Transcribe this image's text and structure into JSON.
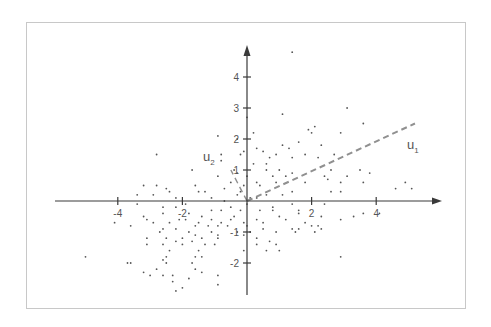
{
  "chart_data": {
    "type": "scatter",
    "title": "",
    "xlabel": "",
    "ylabel": "",
    "xlim": [
      -5.9,
      6.1
    ],
    "ylim": [
      -3.0,
      5.0
    ],
    "grid": false,
    "legend": null,
    "x_ticks": [
      -4,
      -2,
      2,
      4
    ],
    "y_ticks": [
      -2,
      -1,
      1,
      2,
      3,
      4
    ],
    "x_tick_labels": [
      "-4",
      "-2",
      "2",
      "4"
    ],
    "y_tick_labels": [
      "-2",
      "-1",
      "1",
      "2",
      "3",
      "4"
    ],
    "vectors": [
      {
        "name": "u1",
        "label": "u",
        "subscript": "1",
        "from": [
          0,
          0
        ],
        "to": [
          5.2,
          2.5
        ],
        "style": "dashed"
      },
      {
        "name": "u2",
        "label": "u",
        "subscript": "2",
        "from": [
          0,
          0
        ],
        "to": [
          -0.5,
          1.0
        ],
        "style": "dashed"
      }
    ],
    "series": [
      {
        "name": "points",
        "points": [
          [
            1.4,
            4.8
          ],
          [
            3.1,
            3.0
          ],
          [
            0.0,
            2.7
          ],
          [
            1.1,
            2.8
          ],
          [
            3.6,
            2.5
          ],
          [
            1.9,
            2.3
          ],
          [
            2.1,
            2.4
          ],
          [
            2.0,
            2.2
          ],
          [
            2.9,
            2.2
          ],
          [
            0.2,
            2.2
          ],
          [
            -0.9,
            2.1
          ],
          [
            -0.3,
            2.0
          ],
          [
            1.1,
            1.8
          ],
          [
            1.6,
            1.9
          ],
          [
            2.3,
            1.8
          ],
          [
            1.3,
            1.7
          ],
          [
            -0.1,
            1.6
          ],
          [
            0.3,
            1.7
          ],
          [
            0.5,
            1.6
          ],
          [
            0.9,
            1.5
          ],
          [
            -2.8,
            1.5
          ],
          [
            -0.8,
            1.5
          ],
          [
            -0.2,
            1.5
          ],
          [
            1.8,
            1.5
          ],
          [
            2.7,
            1.5
          ],
          [
            0.7,
            1.4
          ],
          [
            1.4,
            1.4
          ],
          [
            0.6,
            1.2
          ],
          [
            0.2,
            1.2
          ],
          [
            -0.8,
            1.3
          ],
          [
            2.2,
            1.4
          ],
          [
            -1.7,
            1.0
          ],
          [
            -0.4,
            1.0
          ],
          [
            0.6,
            1.0
          ],
          [
            1.0,
            1.0
          ],
          [
            2.6,
            1.0
          ],
          [
            1.4,
            0.9
          ],
          [
            3.5,
            1.0
          ],
          [
            3.8,
            0.9
          ],
          [
            -0.9,
            0.8
          ],
          [
            -0.3,
            0.9
          ],
          [
            0.0,
            0.8
          ],
          [
            0.8,
            0.8
          ],
          [
            1.2,
            0.8
          ],
          [
            2.4,
            0.8
          ],
          [
            3.1,
            0.8
          ],
          [
            2.5,
            0.7
          ],
          [
            2.9,
            0.6
          ],
          [
            0.3,
            0.6
          ],
          [
            -0.5,
            0.6
          ],
          [
            -1.6,
            0.5
          ],
          [
            -3.2,
            0.5
          ],
          [
            -2.8,
            0.5
          ],
          [
            0.9,
            0.6
          ],
          [
            1.8,
            0.6
          ],
          [
            3.6,
            0.6
          ],
          [
            4.9,
            0.6
          ],
          [
            -0.1,
            0.5
          ],
          [
            0.4,
            0.5
          ],
          [
            -1.3,
            0.3
          ],
          [
            -2.5,
            0.4
          ],
          [
            -2.4,
            0.3
          ],
          [
            -0.7,
            0.4
          ],
          [
            -0.2,
            0.3
          ],
          [
            1.4,
            0.3
          ],
          [
            2.6,
            0.3
          ],
          [
            4.6,
            0.4
          ],
          [
            5.1,
            0.4
          ],
          [
            2.9,
            0.3
          ],
          [
            -1.5,
            0.3
          ],
          [
            -0.3,
            0.2
          ],
          [
            0.6,
            0.2
          ],
          [
            1.1,
            0.2
          ],
          [
            -3.4,
            0.2
          ],
          [
            -2.9,
            0.2
          ],
          [
            -2.2,
            0.1
          ],
          [
            -1.1,
            0.1
          ],
          [
            0.1,
            0.1
          ],
          [
            0.3,
            0.1
          ],
          [
            -0.7,
            0.0
          ],
          [
            -3.4,
            -0.1
          ],
          [
            -1.9,
            -0.1
          ],
          [
            0.0,
            -0.1
          ],
          [
            1.4,
            -0.1
          ],
          [
            2.4,
            -0.1
          ],
          [
            -0.5,
            -0.2
          ],
          [
            0.8,
            -0.2
          ],
          [
            -2.2,
            -0.2
          ],
          [
            -2.6,
            -0.2
          ],
          [
            -1.1,
            -0.3
          ],
          [
            -0.2,
            -0.3
          ],
          [
            1.6,
            -0.3
          ],
          [
            -2.6,
            -0.4
          ],
          [
            -1.8,
            -0.4
          ],
          [
            -0.8,
            -0.3
          ],
          [
            0.4,
            -0.3
          ],
          [
            0.8,
            -0.3
          ],
          [
            1.6,
            -0.4
          ],
          [
            -3.2,
            -0.5
          ],
          [
            -1.4,
            -0.5
          ],
          [
            -0.4,
            -0.5
          ],
          [
            1.0,
            -0.5
          ],
          [
            2.3,
            -0.5
          ],
          [
            -2.9,
            -0.7
          ],
          [
            -2.1,
            -0.6
          ],
          [
            -1.9,
            -0.6
          ],
          [
            -1.1,
            -0.6
          ],
          [
            -0.5,
            -0.6
          ],
          [
            -0.1,
            -0.7
          ],
          [
            0.3,
            -0.6
          ],
          [
            1.2,
            -0.6
          ],
          [
            3.3,
            -0.5
          ],
          [
            3.6,
            -0.4
          ],
          [
            4.1,
            -0.4
          ],
          [
            -3.1,
            -0.6
          ],
          [
            -2.4,
            -0.7
          ],
          [
            -1.5,
            -0.7
          ],
          [
            -0.8,
            -0.7
          ],
          [
            0.5,
            -0.7
          ],
          [
            1.8,
            -0.7
          ],
          [
            2.9,
            -0.6
          ],
          [
            -4.1,
            -0.7
          ],
          [
            -3.6,
            -0.8
          ],
          [
            -2.6,
            -0.9
          ],
          [
            -1.6,
            -0.8
          ],
          [
            -1.2,
            -0.8
          ],
          [
            -0.9,
            -0.8
          ],
          [
            -0.6,
            -0.8
          ],
          [
            0.0,
            -0.8
          ],
          [
            1.4,
            -0.9
          ],
          [
            2.0,
            -0.8
          ],
          [
            2.2,
            -0.8
          ],
          [
            -2.2,
            -0.9
          ],
          [
            -1.8,
            -1.0
          ],
          [
            -2.7,
            -1.0
          ],
          [
            -1.1,
            -1.0
          ],
          [
            -0.3,
            -1.0
          ],
          [
            0.5,
            -0.9
          ],
          [
            0.9,
            -1.0
          ],
          [
            1.6,
            -0.9
          ],
          [
            1.5,
            -1.0
          ],
          [
            2.1,
            -1.0
          ],
          [
            2.3,
            -0.9
          ],
          [
            -0.9,
            -1.1
          ],
          [
            -0.1,
            -1.1
          ],
          [
            0.1,
            -1.0
          ],
          [
            0.3,
            -1.2
          ],
          [
            -1.6,
            -1.1
          ],
          [
            -2.0,
            -1.2
          ],
          [
            -2.5,
            -1.2
          ],
          [
            -3.1,
            -1.2
          ],
          [
            -1.4,
            -1.2
          ],
          [
            -0.9,
            -1.2
          ],
          [
            -2.2,
            -1.3
          ],
          [
            -1.7,
            -1.3
          ],
          [
            -1.3,
            -1.4
          ],
          [
            0.7,
            -1.3
          ],
          [
            -3.1,
            -1.4
          ],
          [
            -2.6,
            -1.4
          ],
          [
            -2.0,
            -1.4
          ],
          [
            -1.0,
            -1.4
          ],
          [
            0.3,
            -1.4
          ],
          [
            0.9,
            -1.4
          ],
          [
            -2.4,
            -1.6
          ],
          [
            -1.5,
            -1.6
          ],
          [
            0.6,
            -1.6
          ],
          [
            1.0,
            -1.6
          ],
          [
            -0.1,
            -1.6
          ],
          [
            -2.5,
            -1.8
          ],
          [
            -1.6,
            -1.8
          ],
          [
            -1.4,
            -1.8
          ],
          [
            -5.0,
            -1.8
          ],
          [
            2.9,
            -1.8
          ],
          [
            -3.7,
            -2.0
          ],
          [
            -3.6,
            -2.0
          ],
          [
            -2.6,
            -1.9
          ],
          [
            -2.5,
            -2.0
          ],
          [
            -1.7,
            -2.0
          ],
          [
            -1.6,
            -2.2
          ],
          [
            -2.8,
            -2.2
          ],
          [
            -1.4,
            -2.3
          ],
          [
            -3.2,
            -2.3
          ],
          [
            -2.6,
            -2.4
          ],
          [
            -2.3,
            -2.4
          ],
          [
            -0.9,
            -2.4
          ],
          [
            -3.0,
            -2.4
          ],
          [
            -1.8,
            -2.5
          ],
          [
            -2.3,
            -2.6
          ],
          [
            -0.9,
            -2.7
          ],
          [
            -2.2,
            -2.9
          ],
          [
            -2.0,
            -2.8
          ]
        ]
      }
    ]
  },
  "axes": {
    "x_ticks": [
      {
        "value": -4,
        "label": "-4"
      },
      {
        "value": -2,
        "label": "-2"
      },
      {
        "value": 2,
        "label": "2"
      },
      {
        "value": 4,
        "label": "4"
      }
    ],
    "y_ticks": [
      {
        "value": 4,
        "label": "4"
      },
      {
        "value": 3,
        "label": "3"
      },
      {
        "value": 2,
        "label": "2"
      },
      {
        "value": 1,
        "label": "1"
      },
      {
        "value": -1,
        "label": "-1"
      },
      {
        "value": -2,
        "label": "-2"
      }
    ]
  },
  "labels": {
    "u1_main": "u",
    "u1_sub": "1",
    "u2_main": "u",
    "u2_sub": "2"
  },
  "colors": {
    "axis": "#3a3a3a",
    "point": "#555555",
    "vector": "#909090",
    "frame": "#c8c8c8"
  }
}
